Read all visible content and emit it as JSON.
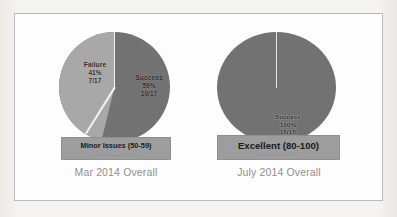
{
  "slide": {
    "background_color": "#fdfdfd",
    "page_color": "#f2f1ef",
    "border_color": "#b9b9b9"
  },
  "charts": [
    {
      "id": "mar-2014",
      "caption": "Mar 2014 Overall",
      "banner_title": "Minor Issues (50-59)",
      "banner_sub": "Minor Issues (50-59)",
      "slices": [
        {
          "name": "Failure",
          "percent_label": "41%",
          "fraction_label": "7/17",
          "value": 41,
          "color": "#a6a6a6"
        },
        {
          "name": "Success",
          "percent_label": "59%",
          "fraction_label": "10/17",
          "value": 59,
          "color": "#6e6e6e"
        }
      ]
    },
    {
      "id": "july-2014",
      "caption": "July 2014 Overall",
      "banner_title": "Excellent (80-100)",
      "banner_sub": "Excellent (80-100)",
      "slices": [
        {
          "name": "Success",
          "percent_label": "100%",
          "fraction_label": "15/15",
          "value": 100,
          "color": "#6e6e6e"
        }
      ]
    }
  ],
  "chart_data": [
    {
      "type": "pie",
      "title": "Mar 2014 Overall",
      "categories": [
        "Failure",
        "Success"
      ],
      "values": [
        41,
        59
      ],
      "counts": [
        7,
        10
      ],
      "total": 17,
      "value_labels": [
        "41%",
        "59%"
      ],
      "count_labels": [
        "7/17",
        "10/17"
      ],
      "colors": [
        "#a6a6a6",
        "#6e6e6e"
      ],
      "annotation": "Minor Issues (50-59)",
      "legend": "none",
      "grid": false,
      "xlabel": "",
      "ylabel": ""
    },
    {
      "type": "pie",
      "title": "July 2014 Overall",
      "categories": [
        "Success"
      ],
      "values": [
        100
      ],
      "counts": [
        15
      ],
      "total": 15,
      "value_labels": [
        "100%"
      ],
      "count_labels": [
        "15/15"
      ],
      "colors": [
        "#6e6e6e"
      ],
      "annotation": "Excellent (80-100)",
      "legend": "none",
      "grid": false,
      "xlabel": "",
      "ylabel": ""
    }
  ]
}
